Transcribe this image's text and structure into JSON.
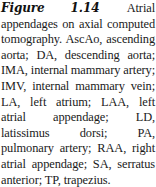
{
  "figure": {
    "label": "Figure 1.14",
    "caption": "Atrial appendages on axial computed tomography. AscAo, ascending aorta; DA, descending aorta; IMA, internal mammary artery; IMV, internal mammary vein; LA, left atrium; LAA, left atrial appendage; LD, latissimus dorsi; PA, pulmonary artery; RAA, right atrial appendage; SA, serratus ante­rior; TP, trapezius."
  }
}
